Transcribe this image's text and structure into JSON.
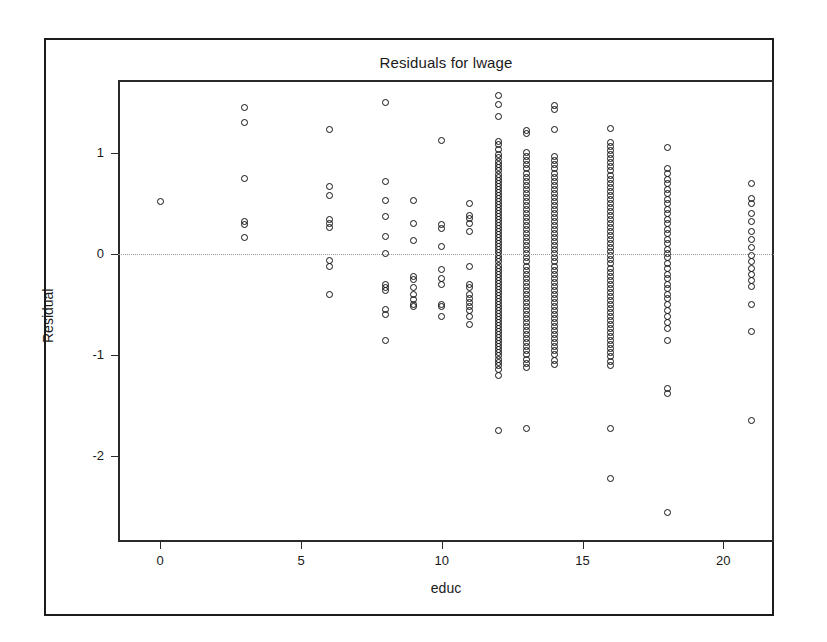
{
  "figure": {
    "outer_frame": {
      "x": 44,
      "y": 38,
      "width": 730,
      "height": 578
    },
    "plot_frame": {
      "x": 118,
      "y": 80,
      "width": 656,
      "height": 462
    }
  },
  "chart_data": {
    "type": "scatter",
    "title": "Residuals for lwage",
    "xlabel": "educ",
    "ylabel": "Residual",
    "xlim": [
      -1.5,
      21.8
    ],
    "ylim": [
      -2.85,
      1.72
    ],
    "xticks": [
      0,
      5,
      10,
      15,
      20
    ],
    "xtick_labels": [
      "0",
      "5",
      "10",
      "15",
      "20"
    ],
    "yticks": [
      1,
      0,
      -1,
      -2
    ],
    "ytick_labels": [
      "1",
      "0",
      "-1",
      "-2"
    ],
    "grid": false,
    "reference_line": {
      "axis": "y",
      "value": 0,
      "style": "dotted",
      "color": "#9a9a9a"
    },
    "marker": {
      "shape": "circle",
      "filled": false,
      "edge_color": "#111111",
      "size": 7
    },
    "legend": null,
    "points": [
      {
        "x": 0,
        "y": [
          0.52
        ]
      },
      {
        "x": 3,
        "y": [
          1.45,
          1.3,
          0.75,
          0.32,
          0.29,
          0.16
        ]
      },
      {
        "x": 6,
        "y": [
          1.23,
          0.67,
          0.58,
          0.34,
          0.3,
          0.26,
          -0.07,
          -0.12,
          -0.4
        ]
      },
      {
        "x": 8,
        "y": [
          1.5,
          0.72,
          0.53,
          0.37,
          0.17,
          0.0,
          -0.3,
          -0.33,
          -0.36,
          -0.55,
          -0.6,
          -0.86
        ]
      },
      {
        "x": 9,
        "y": [
          0.53,
          0.3,
          0.13,
          -0.22,
          -0.25,
          -0.33,
          -0.4,
          -0.45,
          -0.5,
          -0.52
        ]
      },
      {
        "x": 10,
        "y": [
          1.12,
          0.29,
          0.25,
          0.07,
          -0.15,
          -0.24,
          -0.3,
          -0.5,
          -0.52,
          -0.62
        ]
      },
      {
        "x": 11,
        "y": [
          0.5,
          0.38,
          0.35,
          0.3,
          0.22,
          -0.12,
          -0.3,
          -0.33,
          -0.4,
          -0.44,
          -0.48,
          -0.52,
          -0.56,
          -0.62,
          -0.7
        ]
      },
      {
        "x": 12,
        "y": [
          1.57,
          1.48,
          1.36,
          1.11,
          1.08,
          1.03,
          0.98,
          0.95,
          0.91,
          0.88,
          0.85,
          0.82,
          0.79,
          0.76,
          0.73,
          0.7,
          0.67,
          0.64,
          0.61,
          0.58,
          0.55,
          0.52,
          0.49,
          0.46,
          0.43,
          0.4,
          0.37,
          0.34,
          0.31,
          0.28,
          0.25,
          0.22,
          0.19,
          0.16,
          0.13,
          0.1,
          0.07,
          0.04,
          0.01,
          -0.02,
          -0.05,
          -0.08,
          -0.11,
          -0.14,
          -0.17,
          -0.2,
          -0.23,
          -0.26,
          -0.29,
          -0.32,
          -0.35,
          -0.38,
          -0.41,
          -0.44,
          -0.47,
          -0.5,
          -0.53,
          -0.56,
          -0.59,
          -0.62,
          -0.65,
          -0.68,
          -0.71,
          -0.74,
          -0.77,
          -0.8,
          -0.83,
          -0.86,
          -0.89,
          -0.92,
          -0.95,
          -0.98,
          -1.01,
          -1.04,
          -1.07,
          -1.1,
          -1.14,
          -1.2,
          -1.75
        ]
      },
      {
        "x": 13,
        "y": [
          1.22,
          1.19,
          1.0,
          0.96,
          0.92,
          0.88,
          0.84,
          0.8,
          0.76,
          0.72,
          0.68,
          0.64,
          0.6,
          0.56,
          0.52,
          0.48,
          0.44,
          0.4,
          0.36,
          0.32,
          0.28,
          0.24,
          0.2,
          0.16,
          0.12,
          0.08,
          0.04,
          0.0,
          -0.04,
          -0.08,
          -0.12,
          -0.16,
          -0.2,
          -0.24,
          -0.28,
          -0.32,
          -0.36,
          -0.4,
          -0.44,
          -0.48,
          -0.52,
          -0.56,
          -0.6,
          -0.64,
          -0.68,
          -0.72,
          -0.76,
          -0.8,
          -0.84,
          -0.88,
          -0.92,
          -0.96,
          -1.0,
          -1.04,
          -1.08,
          -1.12,
          -1.73
        ]
      },
      {
        "x": 14,
        "y": [
          1.47,
          1.43,
          1.23,
          0.96,
          0.92,
          0.88,
          0.84,
          0.8,
          0.76,
          0.72,
          0.68,
          0.64,
          0.6,
          0.56,
          0.52,
          0.48,
          0.44,
          0.4,
          0.36,
          0.32,
          0.28,
          0.24,
          0.2,
          0.16,
          0.12,
          0.08,
          0.04,
          0.0,
          -0.04,
          -0.08,
          -0.12,
          -0.16,
          -0.2,
          -0.24,
          -0.28,
          -0.32,
          -0.36,
          -0.4,
          -0.44,
          -0.48,
          -0.52,
          -0.56,
          -0.6,
          -0.64,
          -0.68,
          -0.72,
          -0.76,
          -0.8,
          -0.84,
          -0.88,
          -0.92,
          -0.96,
          -1.0,
          -1.05,
          -1.09
        ]
      },
      {
        "x": 16,
        "y": [
          1.24,
          1.1,
          1.06,
          1.02,
          0.98,
          0.94,
          0.9,
          0.86,
          0.82,
          0.78,
          0.74,
          0.7,
          0.66,
          0.62,
          0.58,
          0.54,
          0.5,
          0.46,
          0.42,
          0.38,
          0.34,
          0.3,
          0.26,
          0.22,
          0.18,
          0.14,
          0.1,
          0.06,
          0.02,
          -0.02,
          -0.06,
          -0.1,
          -0.14,
          -0.18,
          -0.22,
          -0.26,
          -0.3,
          -0.34,
          -0.38,
          -0.42,
          -0.46,
          -0.5,
          -0.54,
          -0.58,
          -0.62,
          -0.66,
          -0.7,
          -0.74,
          -0.78,
          -0.82,
          -0.86,
          -0.9,
          -0.94,
          -0.98,
          -1.02,
          -1.06,
          -1.1,
          -1.73,
          -2.22
        ]
      },
      {
        "x": 18,
        "y": [
          1.05,
          0.84,
          0.8,
          0.74,
          0.7,
          0.64,
          0.6,
          0.54,
          0.5,
          0.44,
          0.4,
          0.34,
          0.3,
          0.24,
          0.2,
          0.14,
          0.1,
          0.04,
          0.0,
          -0.04,
          -0.1,
          -0.14,
          -0.2,
          -0.24,
          -0.3,
          -0.34,
          -0.4,
          -0.44,
          -0.5,
          -0.56,
          -0.62,
          -0.68,
          -0.74,
          -0.86,
          -1.33,
          -1.38,
          -2.56
        ]
      },
      {
        "x": 21,
        "y": [
          0.7,
          0.55,
          0.5,
          0.4,
          0.32,
          0.22,
          0.14,
          0.06,
          -0.02,
          -0.08,
          -0.14,
          -0.2,
          -0.26,
          -0.32,
          -0.5,
          -0.77,
          -1.65
        ]
      }
    ]
  }
}
